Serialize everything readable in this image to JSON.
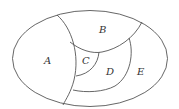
{
  "diagram": {
    "type": "region-partition",
    "stroke_color": "#555555",
    "regions": [
      {
        "id": "A",
        "label": "A",
        "x": 47,
        "y": 64
      },
      {
        "id": "B",
        "label": "B",
        "x": 102,
        "y": 33
      },
      {
        "id": "C",
        "label": "C",
        "x": 85,
        "y": 64
      },
      {
        "id": "D",
        "label": "D",
        "x": 109,
        "y": 75
      },
      {
        "id": "E",
        "label": "E",
        "x": 140,
        "y": 75
      }
    ]
  }
}
